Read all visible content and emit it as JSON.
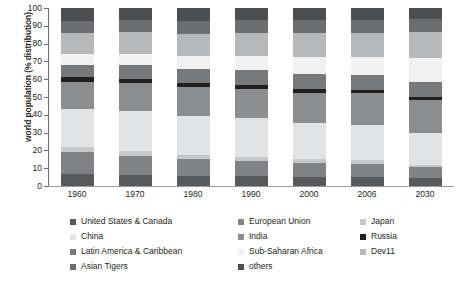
{
  "chart_data": {
    "type": "bar",
    "stacked": true,
    "title": "",
    "xlabel": "",
    "ylabel": "world population (% distribution)",
    "ylim": [
      0,
      100
    ],
    "yticks": [
      0,
      10,
      20,
      30,
      40,
      50,
      60,
      70,
      80,
      90,
      100
    ],
    "grid": false,
    "legend_position": "bottom",
    "categories": [
      "1960",
      "1970",
      "1980",
      "1990",
      "2000",
      "2006",
      "2030"
    ],
    "series": [
      {
        "name": "United States & Canada",
        "color": "#58595b",
        "values": [
          6.5,
          6.0,
          5.5,
          5.5,
          5.0,
          5.0,
          4.5
        ]
      },
      {
        "name": "European Union",
        "color": "#808285",
        "values": [
          12.5,
          11.0,
          9.5,
          8.5,
          8.0,
          7.5,
          6.0
        ]
      },
      {
        "name": "Japan",
        "color": "#c7c8ca",
        "values": [
          3.0,
          2.8,
          2.5,
          2.5,
          2.0,
          2.0,
          1.5
        ]
      },
      {
        "name": "China",
        "color": "#e2e3e4",
        "values": [
          21.5,
          22.5,
          22.0,
          21.5,
          20.5,
          20.0,
          18.0
        ]
      },
      {
        "name": "India",
        "color": "#8b8d8f",
        "values": [
          15.0,
          15.5,
          16.0,
          16.5,
          17.0,
          17.5,
          18.5
        ]
      },
      {
        "name": "Russia",
        "color": "#231f20",
        "values": [
          2.5,
          2.5,
          2.5,
          2.5,
          2.0,
          2.0,
          1.5
        ]
      },
      {
        "name": "Latin America & Caribbean",
        "color": "#76787a",
        "values": [
          7.0,
          7.5,
          8.0,
          8.0,
          8.5,
          8.5,
          8.5
        ]
      },
      {
        "name": "Sub-Saharan Africa",
        "color": "#f1f1f2",
        "values": [
          6.0,
          6.5,
          7.0,
          8.0,
          9.5,
          10.0,
          13.5
        ]
      },
      {
        "name": "Dev11",
        "color": "#b6b8ba",
        "values": [
          12.0,
          12.0,
          12.5,
          13.0,
          13.5,
          13.5,
          14.5
        ]
      },
      {
        "name": "Asian Tigers",
        "color": "#6d6e71",
        "values": [
          7.0,
          7.2,
          7.5,
          7.5,
          7.5,
          7.5,
          7.5
        ]
      },
      {
        "name": "others",
        "color": "#4d4e50",
        "values": [
          7.0,
          6.5,
          7.0,
          6.5,
          6.5,
          6.5,
          6.0
        ]
      }
    ]
  },
  "axis": {
    "y_title": "world population (% distribution)",
    "y_ticks": [
      "100",
      "90",
      "80",
      "70",
      "60",
      "50",
      "40",
      "30",
      "20",
      "10",
      "0"
    ],
    "x_ticks": [
      "1960",
      "1970",
      "1980",
      "1990",
      "2000",
      "2006",
      "2030"
    ]
  },
  "legend": {
    "columns": [
      [
        {
          "label": "United States & Canada",
          "color": "#58595b"
        },
        {
          "label": "China",
          "color": "#e2e3e4"
        },
        {
          "label": "Latin America & Caribbean",
          "color": "#76787a"
        },
        {
          "label": "Asian Tigers",
          "color": "#6d6e71"
        }
      ],
      [
        {
          "label": "European Union",
          "color": "#808285"
        },
        {
          "label": "India",
          "color": "#8b8d8f"
        },
        {
          "label": "Sub-Saharan Africa",
          "color": "#f1f1f2"
        },
        {
          "label": "others",
          "color": "#4d4e50"
        }
      ],
      [
        {
          "label": "Japan",
          "color": "#c7c8ca"
        },
        {
          "label": "Russia",
          "color": "#231f20"
        },
        {
          "label": "Dev11",
          "color": "#b6b8ba"
        }
      ]
    ]
  }
}
